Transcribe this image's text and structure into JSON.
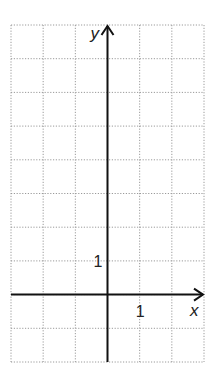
{
  "chart_data": {
    "type": "scatter",
    "title": "",
    "xlabel": "x",
    "ylabel": "y",
    "x_tick_labels": [
      {
        "value": 1,
        "label": "1"
      }
    ],
    "y_tick_labels": [
      {
        "value": 1,
        "label": "1"
      }
    ],
    "xlim": [
      -3,
      3
    ],
    "ylim": [
      -2,
      8
    ],
    "grid": true,
    "grid_style": "dotted",
    "grid_step": 1,
    "series": [],
    "legend": null
  },
  "labels": {
    "x_axis": "x",
    "y_axis": "y",
    "x_tick": "1",
    "y_tick": "1"
  },
  "colors": {
    "axis": "#111111",
    "grid": "#9a9a9a",
    "background": "#ffffff"
  }
}
